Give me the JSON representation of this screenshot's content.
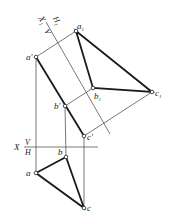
{
  "diagram": {
    "colors": {
      "background": "#ffffff",
      "line": "#1a1a1a",
      "thin": "#555555"
    },
    "axes": {
      "main": {
        "x_label": "X",
        "upper": "V",
        "lower": "H"
      },
      "aux": {
        "x_label": "X",
        "x_sub": "1",
        "upper": "H",
        "upper_sub": "1",
        "lower": "V"
      }
    },
    "labels": {
      "a_prime": "a'",
      "b_prime": "b'",
      "c_prime": "c'",
      "a": "a",
      "b": "b",
      "c": "c",
      "a1": "a",
      "a1_sub": "1",
      "b1": "b",
      "b1_sub": "1",
      "c1": "c",
      "c1_sub": "1"
    },
    "points": {
      "a_prime": [
        36,
        57
      ],
      "b_prime": [
        65,
        106
      ],
      "c_prime": [
        84,
        136
      ],
      "a": [
        36,
        173
      ],
      "b": [
        66,
        157
      ],
      "c": [
        84,
        208
      ],
      "a1": [
        76,
        31
      ],
      "b1": [
        93,
        88
      ],
      "c1": [
        152,
        92
      ]
    }
  }
}
